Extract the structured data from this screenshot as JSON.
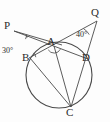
{
  "figure": {
    "background_color": "#fdfdfd",
    "stroke_color": "#4a4a4a",
    "label_color": "#2b2b2b",
    "circle": {
      "cx": 59,
      "cy": 75,
      "r": 33
    },
    "points": [
      {
        "id": "P",
        "label": "P",
        "x": 14,
        "y": 31,
        "on_circle": false
      },
      {
        "id": "Q",
        "label": "Q",
        "x": 97,
        "y": 21,
        "on_circle": false
      },
      {
        "id": "A",
        "label": "A",
        "x": 54,
        "y": 48,
        "on_circle": true
      },
      {
        "id": "B",
        "label": "B",
        "x": 30,
        "y": 58,
        "on_circle": true
      },
      {
        "id": "D",
        "label": "D",
        "x": 86,
        "y": 59,
        "on_circle": true
      },
      {
        "id": "C",
        "label": "C",
        "x": 71,
        "y": 107,
        "on_circle": true
      }
    ],
    "segments": [
      {
        "from": "P",
        "to": "A"
      },
      {
        "from": "P",
        "to": "D"
      },
      {
        "from": "Q",
        "to": "A"
      },
      {
        "from": "Q",
        "to": "C"
      },
      {
        "from": "B",
        "to": "D"
      },
      {
        "from": "B",
        "to": "C"
      },
      {
        "from": "A",
        "to": "C"
      }
    ],
    "angles": [
      {
        "id": "angle-P",
        "vertex": "P",
        "label": "30°",
        "value": 30,
        "unit": "degrees"
      },
      {
        "id": "angle-Q",
        "vertex": "Q",
        "label": "40°",
        "value": 40,
        "unit": "degrees"
      }
    ],
    "angle_marks": [
      {
        "id": "arc-at-P",
        "vertex": "P",
        "radius": 13
      },
      {
        "id": "arc-at-Q",
        "vertex": "Q",
        "radius": 14
      },
      {
        "id": "arc-at-A",
        "vertex": "A",
        "radius": 7
      },
      {
        "id": "arc-at-B",
        "vertex": "B",
        "radius": 6
      }
    ]
  }
}
